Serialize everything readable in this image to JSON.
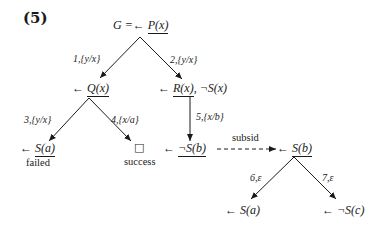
{
  "figure": {
    "number_label": "(5)"
  },
  "nodes": {
    "root": {
      "prefix": "G =←",
      "atom": "P(x)"
    },
    "q": {
      "prefix": "←",
      "atom": "Q(x)"
    },
    "r": {
      "prefix": "←",
      "atom_underlined": "R(x)",
      "rest": ", ¬S(x)"
    },
    "sa_failed": {
      "prefix": "←",
      "atom": "S(a)",
      "status": "failed"
    },
    "success": {
      "symbol": "□",
      "status": "success"
    },
    "notsb": {
      "prefix": "←",
      "atom": "¬S(b)"
    },
    "sb": {
      "prefix": "←",
      "atom": "S(b)"
    },
    "sa_leaf": {
      "prefix": "←",
      "text": "S(a)"
    },
    "notsc_leaf": {
      "prefix": "←",
      "text": "¬S(c)"
    }
  },
  "edges": [
    {
      "id": "e1",
      "label": "1,{y/x}",
      "from": "root",
      "to": "q"
    },
    {
      "id": "e2",
      "label": "2,{y/x}",
      "from": "root",
      "to": "r"
    },
    {
      "id": "e3",
      "label": "3,{y/x}",
      "from": "q",
      "to": "sa_failed"
    },
    {
      "id": "e4",
      "label": "4,{x/a}",
      "from": "q",
      "to": "success"
    },
    {
      "id": "e5",
      "label": "5,{x/b}",
      "from": "r",
      "to": "notsb"
    },
    {
      "id": "subsid",
      "label": "subsid",
      "from": "notsb",
      "to": "sb",
      "style": "dashed"
    },
    {
      "id": "e6",
      "label": "6,ε",
      "from": "sb",
      "to": "sa_leaf"
    },
    {
      "id": "e7",
      "label": "7,ε",
      "from": "sb",
      "to": "notsc_leaf"
    }
  ]
}
